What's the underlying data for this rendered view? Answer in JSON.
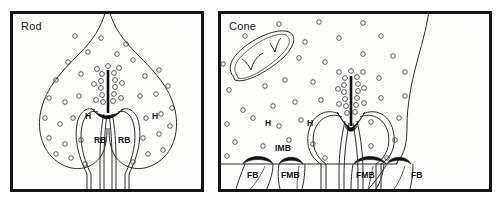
{
  "figure": {
    "kind": "scientific-diagram",
    "background_color": "#fdfdfb",
    "line_color": "#2a2a2a",
    "frame_color": "#151515"
  },
  "panels": [
    {
      "id": "rod",
      "title": "Rod",
      "labels": [
        {
          "name": "horizontal-cell-left",
          "text": "H",
          "x": 76,
          "y": 104
        },
        {
          "name": "horizontal-cell-right",
          "text": "H",
          "x": 143,
          "y": 104
        },
        {
          "name": "rod-bipolar-left",
          "text": "RB",
          "x": 89,
          "y": 128
        },
        {
          "name": "rod-bipolar-right",
          "text": "RB",
          "x": 118,
          "y": 128
        }
      ]
    },
    {
      "id": "cone",
      "title": "Cone",
      "labels": [
        {
          "name": "horizontal-cell-left",
          "text": "H",
          "x": 322,
          "y": 111
        },
        {
          "name": "horizontal-cell-right",
          "text": "H",
          "x": 364,
          "y": 111
        },
        {
          "name": "invaginating-midget-bipolar",
          "text": "IMB",
          "x": 334,
          "y": 136
        },
        {
          "name": "flat-bipolar-left",
          "text": "FB",
          "x": 262,
          "y": 172
        },
        {
          "name": "flat-midget-bipolar-left",
          "text": "FMB",
          "x": 298,
          "y": 172
        },
        {
          "name": "flat-midget-bipolar-right",
          "text": "FMB",
          "x": 379,
          "y": 172
        },
        {
          "name": "flat-bipolar-right",
          "text": "FB",
          "x": 432,
          "y": 172
        }
      ]
    }
  ],
  "legend_note": ""
}
